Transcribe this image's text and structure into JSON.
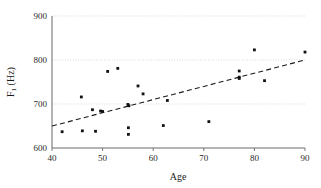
{
  "chart_data": {
    "type": "scatter",
    "title": "",
    "xlabel": "Age",
    "ylabel": "F1 (Hz)",
    "ylabel_base": "F",
    "ylabel_subscript": "1",
    "ylabel_unit": "(Hz)",
    "xlim": [
      40,
      90
    ],
    "ylim": [
      600,
      900
    ],
    "xticks": [
      40,
      50,
      60,
      70,
      80,
      90
    ],
    "yticks": [
      600,
      700,
      800,
      900
    ],
    "xtick_labels": [
      "40",
      "50",
      "60",
      "70",
      "80",
      "90"
    ],
    "ytick_labels": [
      "600",
      "700",
      "800",
      "900"
    ],
    "grid": true,
    "grid_axis": "y",
    "legend": false,
    "marker": "filled-square",
    "marker_color": "#111111",
    "grid_color": "#d2d2d2",
    "axis_color": "#5a5a5a",
    "points": [
      {
        "x": 42.0,
        "y": 637
      },
      {
        "x": 45.8,
        "y": 716
      },
      {
        "x": 46.0,
        "y": 639
      },
      {
        "x": 48.0,
        "y": 687
      },
      {
        "x": 48.6,
        "y": 638
      },
      {
        "x": 49.6,
        "y": 684
      },
      {
        "x": 50.0,
        "y": 683
      },
      {
        "x": 51.0,
        "y": 774
      },
      {
        "x": 53.0,
        "y": 781
      },
      {
        "x": 55.0,
        "y": 699
      },
      {
        "x": 55.2,
        "y": 696
      },
      {
        "x": 55.1,
        "y": 646
      },
      {
        "x": 55.1,
        "y": 631
      },
      {
        "x": 57.0,
        "y": 741
      },
      {
        "x": 58.0,
        "y": 723
      },
      {
        "x": 62.0,
        "y": 651
      },
      {
        "x": 62.8,
        "y": 708
      },
      {
        "x": 71.0,
        "y": 660
      },
      {
        "x": 77.0,
        "y": 775
      },
      {
        "x": 77.0,
        "y": 761
      },
      {
        "x": 77.0,
        "y": 758
      },
      {
        "x": 80.0,
        "y": 823
      },
      {
        "x": 82.0,
        "y": 753
      },
      {
        "x": 90.0,
        "y": 818
      }
    ],
    "trendline": {
      "style": "dashed",
      "x_start": 40,
      "y_start": 650,
      "x_end": 90,
      "y_end": 800
    }
  }
}
